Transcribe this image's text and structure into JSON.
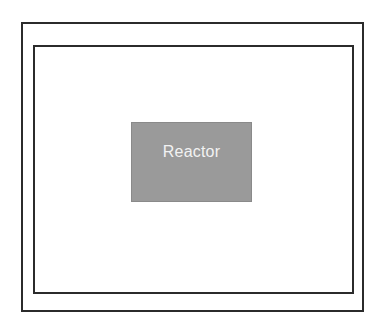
{
  "diagram": {
    "background_color": "#ffffff",
    "boundaries": [
      {
        "name": "outer-boundary",
        "label": "",
        "stroke_color": "#2b2b2b",
        "stroke_width": "2px",
        "fill": "none"
      },
      {
        "name": "inner-boundary",
        "label": "",
        "stroke_color": "#2b2b2b",
        "stroke_width": "2px",
        "fill": "none"
      }
    ],
    "blocks": [
      {
        "name": "reactor-block",
        "label": "Reactor",
        "fill_color": "#9a9a9a",
        "border_color": "#8a8a8a",
        "text_color": "#f2f2f2"
      }
    ]
  }
}
